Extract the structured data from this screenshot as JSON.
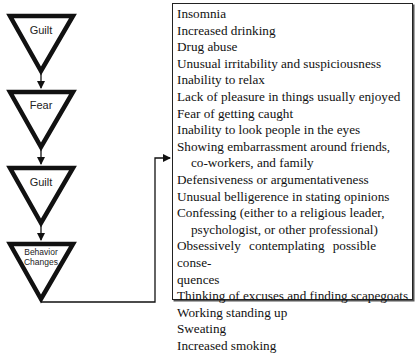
{
  "flowchart": {
    "stages": [
      {
        "label": "Guilt"
      },
      {
        "label": "Fear"
      },
      {
        "label": "Guilt"
      },
      {
        "label": "Behavior Changes",
        "lines": [
          "Behavior",
          "Changes"
        ]
      }
    ]
  },
  "symptoms_box": {
    "items": [
      {
        "text": "Insomnia"
      },
      {
        "text": "Increased drinking"
      },
      {
        "text": "Drug abuse"
      },
      {
        "text": "Unusual irritability and suspiciousness"
      },
      {
        "text": "Inability to relax"
      },
      {
        "text": "Lack of pleasure in things usually enjoyed"
      },
      {
        "text": "Fear of getting caught"
      },
      {
        "text": "Inability to look people in the eyes"
      },
      {
        "text": "Showing embarrassment around friends,",
        "cont": "co-workers, and family"
      },
      {
        "text": "Defensiveness or argumentativeness"
      },
      {
        "text": "Unusual belligerence in stating opinions"
      },
      {
        "text": "Confessing (either to a religious leader,",
        "cont": "psychologist, or other professional)"
      },
      {
        "text": "Obsessively contemplating possible conse-",
        "cont2": "quences"
      },
      {
        "text": "Thinking of excuses and finding scapegoats"
      },
      {
        "text": "Working standing up"
      },
      {
        "text": "Sweating"
      },
      {
        "text": "Increased smoking"
      }
    ]
  },
  "colors": {
    "stroke": "#111111",
    "background": "#ffffff"
  }
}
